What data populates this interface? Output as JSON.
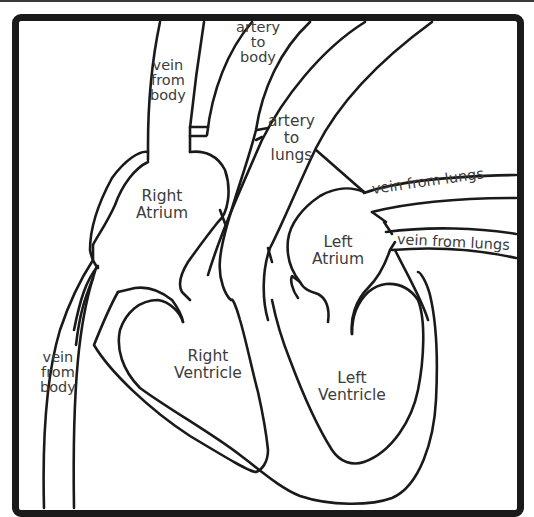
{
  "diagram": {
    "colors": {
      "stroke": "#1a1a1a",
      "text": "#3c3c3c",
      "background": "#ffffff"
    },
    "labels": {
      "vein_from_body_top": [
        "vein",
        "from",
        "body"
      ],
      "artery_to_body": [
        "artery",
        "to",
        "body"
      ],
      "artery_to_lungs": [
        "artery",
        "to",
        "lungs"
      ],
      "vein_from_lungs_upper": "vein from lungs",
      "vein_from_lungs_lower": "vein from lungs",
      "right_atrium": [
        "Right",
        "Atrium"
      ],
      "left_atrium": [
        "Left",
        "Atrium"
      ],
      "right_ventricle": [
        "Right",
        "Ventricle"
      ],
      "left_ventricle": [
        "Left",
        "Ventricle"
      ],
      "vein_from_body_bottom": [
        "vein",
        "from",
        "body"
      ]
    }
  }
}
